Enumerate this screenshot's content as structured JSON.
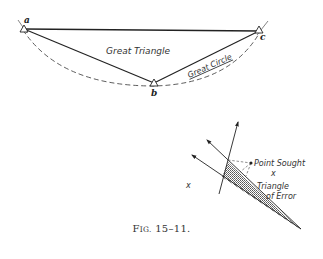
{
  "figure": {
    "caption_prefix": "F",
    "caption_smallcaps": "IG.",
    "caption_number": " 15–11."
  },
  "top_diagram": {
    "stations": [
      {
        "label": "a",
        "x": 23,
        "y": 29
      },
      {
        "label": "b",
        "x": 154,
        "y": 84
      },
      {
        "label": "c",
        "x": 260,
        "y": 30
      }
    ],
    "great_triangle_label": "Great Triangle",
    "great_circle_label": "Great Circle"
  },
  "bottom_diagram": {
    "point_sought_label": "Point Sought",
    "triangle_label_line1": "Triangle",
    "triangle_label_line2": "of Error",
    "x_mark": "x"
  },
  "colors": {
    "ink": "#222222",
    "background": "#ffffff"
  }
}
